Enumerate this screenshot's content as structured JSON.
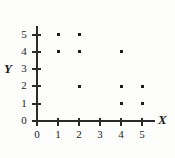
{
  "chart_data": {
    "type": "scatter",
    "title": "",
    "subtitle": "",
    "xlabel": "X",
    "ylabel": "Y",
    "xlim": [
      0,
      5.6
    ],
    "ylim": [
      0,
      5.5
    ],
    "grid": false,
    "legend": false,
    "x_ticks": [
      "0",
      "1",
      "2",
      "3",
      "4",
      "5"
    ],
    "y_ticks": [
      "0",
      "1",
      "2",
      "3",
      "4",
      "5"
    ],
    "x_tick_values": [
      0,
      1,
      2,
      3,
      4,
      5
    ],
    "y_tick_values": [
      0,
      1,
      2,
      3,
      4,
      5
    ],
    "marker_color": "#1c1c1c",
    "axis_color": "#2a2a2a",
    "points": [
      {
        "x": 1,
        "y": 5
      },
      {
        "x": 2,
        "y": 5
      },
      {
        "x": 1,
        "y": 4
      },
      {
        "x": 2,
        "y": 4
      },
      {
        "x": 4,
        "y": 4
      },
      {
        "x": 2,
        "y": 2
      },
      {
        "x": 4,
        "y": 2
      },
      {
        "x": 5,
        "y": 2
      },
      {
        "x": 4,
        "y": 1
      },
      {
        "x": 5,
        "y": 1
      }
    ]
  }
}
